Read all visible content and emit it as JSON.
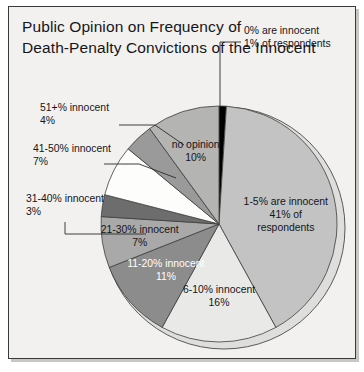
{
  "figure": {
    "title": "Public Opinion on Frequency of\nDeath-Penalty Convictions of the Innocent",
    "frame_color": "#3a3a38",
    "background_color": "#f2f1ef"
  },
  "chart_data": {
    "type": "pie",
    "title": "Public Opinion on Frequency of Death-Penalty Convictions of the Innocent",
    "xlabel": "",
    "ylabel": "",
    "legend_position": "none",
    "grid": false,
    "total": 100,
    "units": "percent of respondents",
    "start_angle_deg": 0,
    "direction": "clockwise",
    "categories": [
      "0% are innocent",
      "1-5% are innocent",
      "6-10% innocent",
      "11-20% innocent",
      "21-30% innocent",
      "31-40% innocent",
      "41-50% innocent",
      "51+% innocent",
      "no opinion"
    ],
    "values": [
      1,
      41,
      16,
      11,
      7,
      3,
      7,
      4,
      10
    ],
    "colors": [
      "#000000",
      "#c3c3c3",
      "#e9e9e7",
      "#8c8c8c",
      "#a9a9a9",
      "#6d6d6d",
      "#fdfdfb",
      "#9a9a9a",
      "#b4b4b2"
    ],
    "slices": [
      {
        "category": "0% are innocent",
        "value": 1,
        "label_line1": "0% are innocent",
        "label_line2": "1% of respondents",
        "label_line3": "",
        "color": "#000000",
        "label_placement": "callout",
        "text_color": "#15151a"
      },
      {
        "category": "1-5% are innocent",
        "value": 41,
        "label_line1": "1-5% are innocent",
        "label_line2": "41% of",
        "label_line3": "respondents",
        "color": "#c3c3c3",
        "label_placement": "inside",
        "text_color": "#15151a"
      },
      {
        "category": "6-10% innocent",
        "value": 16,
        "label_line1": "6-10% innocent",
        "label_line2": "16%",
        "label_line3": "",
        "color": "#e9e9e7",
        "label_placement": "inside",
        "text_color": "#15151a"
      },
      {
        "category": "11-20% innocent",
        "value": 11,
        "label_line1": "11-20% innocent",
        "label_line2": "11%",
        "label_line3": "",
        "color": "#8c8c8c",
        "label_placement": "inside",
        "text_color": "#ffffff"
      },
      {
        "category": "21-30% innocent",
        "value": 7,
        "label_line1": "21-30% innocent",
        "label_line2": "7%",
        "label_line3": "",
        "color": "#a9a9a9",
        "label_placement": "inside",
        "text_color": "#15151a"
      },
      {
        "category": "31-40% innocent",
        "value": 3,
        "label_line1": "31-40% innocent",
        "label_line2": "3%",
        "label_line3": "",
        "color": "#6d6d6d",
        "label_placement": "callout",
        "text_color": "#15151a"
      },
      {
        "category": "41-50% innocent",
        "value": 7,
        "label_line1": "41-50% innocent",
        "label_line2": "7%",
        "label_line3": "",
        "color": "#fdfdfb",
        "label_placement": "callout",
        "text_color": "#15151a"
      },
      {
        "category": "51+% innocent",
        "value": 4,
        "label_line1": "51+% innocent",
        "label_line2": "4%",
        "label_line3": "",
        "color": "#9a9a9a",
        "label_placement": "callout",
        "text_color": "#15151a"
      },
      {
        "category": "no opinion",
        "value": 10,
        "label_line1": "no opinion",
        "label_line2": "10%",
        "label_line3": "",
        "color": "#b4b4b2",
        "label_placement": "inside",
        "text_color": "#15151a"
      }
    ]
  }
}
